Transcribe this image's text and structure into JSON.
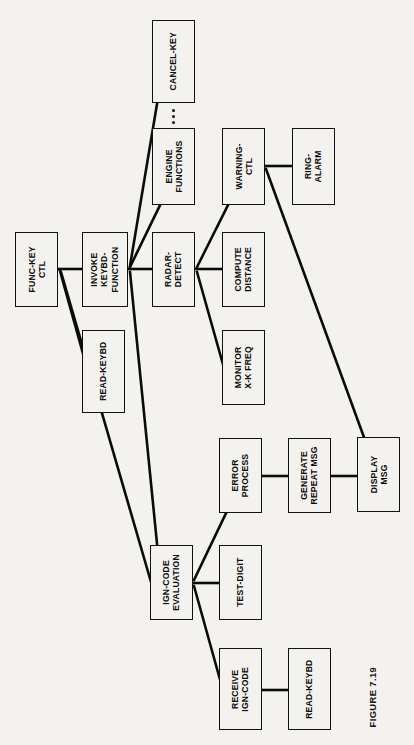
{
  "figure": {
    "caption": "FIGURE 7.19",
    "type": "structure-chart",
    "orientation": "rotated-90-ccw",
    "background_color": "#f4f2ee",
    "line_color": "#0b0b0b",
    "box_fill": "#f4f2ee"
  },
  "nodes": [
    {
      "id": "func-key-ctl",
      "label": "FUNC-KEY\nCTL",
      "x": 15,
      "y": 232,
      "w": 43,
      "h": 75
    },
    {
      "id": "invoke-keybd-function",
      "label": "INVOKE\nKEYBD-\nFUNCTION",
      "x": 82,
      "y": 232,
      "w": 46,
      "h": 75
    },
    {
      "id": "read-keybd-top",
      "label": "READ-KEYBD",
      "x": 82,
      "y": 330,
      "w": 43,
      "h": 83
    },
    {
      "id": "radar-detect",
      "label": "RADAR-\nDETECT",
      "x": 152,
      "y": 232,
      "w": 43,
      "h": 75
    },
    {
      "id": "engine-functions",
      "label": "ENGINE\nFUNCTIONS",
      "x": 152,
      "y": 128,
      "w": 43,
      "h": 77
    },
    {
      "id": "cancel-key",
      "label": "CANCEL-KEY",
      "x": 152,
      "y": 20,
      "w": 43,
      "h": 83
    },
    {
      "id": "warning-ctl",
      "label": "WARNING-\nCTL",
      "x": 222,
      "y": 128,
      "w": 43,
      "h": 77
    },
    {
      "id": "ring-alarm",
      "label": "RING-\nALARM",
      "x": 292,
      "y": 128,
      "w": 43,
      "h": 77
    },
    {
      "id": "compute-distance",
      "label": "COMPUTE\nDISTANCE",
      "x": 222,
      "y": 232,
      "w": 43,
      "h": 75
    },
    {
      "id": "monitor-xk-freq",
      "label": "MONITOR\nX-K FREQ",
      "x": 222,
      "y": 330,
      "w": 43,
      "h": 75
    },
    {
      "id": "ign-code-evaluation",
      "label": "IGN-CODE\nEVALUATION",
      "x": 150,
      "y": 545,
      "w": 43,
      "h": 75
    },
    {
      "id": "error-process",
      "label": "ERROR\nPROCESS",
      "x": 219,
      "y": 438,
      "w": 43,
      "h": 75
    },
    {
      "id": "test-digit",
      "label": "TEST-DIGIT",
      "x": 219,
      "y": 545,
      "w": 43,
      "h": 75
    },
    {
      "id": "receive-ign-code",
      "label": "RECEIVE\nIGN-CODE",
      "x": 219,
      "y": 648,
      "w": 43,
      "h": 82
    },
    {
      "id": "generate-repeat-msg",
      "label": "GENERATE\nREPEAT MSG",
      "x": 288,
      "y": 438,
      "w": 43,
      "h": 75
    },
    {
      "id": "read-keybd-bottom",
      "label": "READ-KEYBD",
      "x": 288,
      "y": 648,
      "w": 43,
      "h": 82
    },
    {
      "id": "display-msg",
      "label": "DISPLAY\nMSG",
      "x": 357,
      "y": 437,
      "w": 43,
      "h": 75
    }
  ],
  "edges": [
    {
      "from": "func-key-ctl",
      "to": "invoke-keybd-function",
      "style": "straight"
    },
    {
      "from": "func-key-ctl",
      "to": "ign-code-evaluation",
      "style": "diagonal"
    },
    {
      "from": "func-key-ctl",
      "to": "read-keybd-top",
      "style": "diagonal"
    },
    {
      "from": "invoke-keybd-function",
      "to": "radar-detect",
      "style": "straight"
    },
    {
      "from": "invoke-keybd-function",
      "to": "engine-functions",
      "style": "diagonal"
    },
    {
      "from": "invoke-keybd-function",
      "to": "cancel-key",
      "style": "diagonal"
    },
    {
      "from": "invoke-keybd-function",
      "to": "ign-code-evaluation",
      "style": "diagonal"
    },
    {
      "from": "radar-detect",
      "to": "compute-distance",
      "style": "straight"
    },
    {
      "from": "radar-detect",
      "to": "warning-ctl",
      "style": "diagonal"
    },
    {
      "from": "radar-detect",
      "to": "monitor-xk-freq",
      "style": "diagonal"
    },
    {
      "from": "warning-ctl",
      "to": "ring-alarm",
      "style": "straight"
    },
    {
      "from": "warning-ctl",
      "to": "display-msg",
      "style": "diagonal"
    },
    {
      "from": "ign-code-evaluation",
      "to": "test-digit",
      "style": "straight"
    },
    {
      "from": "ign-code-evaluation",
      "to": "error-process",
      "style": "diagonal"
    },
    {
      "from": "ign-code-evaluation",
      "to": "receive-ign-code",
      "style": "diagonal"
    },
    {
      "from": "error-process",
      "to": "generate-repeat-msg",
      "style": "straight"
    },
    {
      "from": "generate-repeat-msg",
      "to": "display-msg",
      "style": "straight"
    },
    {
      "from": "receive-ign-code",
      "to": "read-keybd-bottom",
      "style": "straight"
    }
  ],
  "ellipsis": {
    "between": [
      "engine-functions",
      "cancel-key"
    ],
    "count": 3
  }
}
